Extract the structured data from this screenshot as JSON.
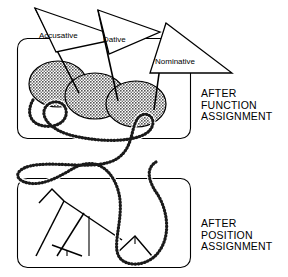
{
  "figure": {
    "background_color": "#ffffff",
    "ink_color": "#000000",
    "ellipse_fill_color": "#9a9a9a"
  },
  "panels": [
    {
      "id": "function-assignment",
      "caption_lines": [
        "AFTER",
        "FUNCTION",
        "ASSIGNMENT"
      ],
      "caption_text": "AFTER\nFUNCTION\nASSIGNMENT",
      "box": {
        "x": 17,
        "y": 38,
        "width": 174,
        "height": 101,
        "radius": 10
      },
      "flags": [
        {
          "label": "Accusative",
          "pole_x": 79,
          "pole_top": 18,
          "pole_bottom": 93
        },
        {
          "label": "Dative",
          "pole_x": 118,
          "pole_top": 10,
          "pole_bottom": 101
        },
        {
          "label": "Nominative",
          "pole_x": 154,
          "pole_top": 23,
          "pole_bottom": 110
        }
      ],
      "blobs": [
        {
          "cx": 58,
          "cy": 84,
          "rx": 29,
          "ry": 23
        },
        {
          "cx": 95,
          "cy": 96,
          "rx": 30,
          "ry": 23
        },
        {
          "cx": 136,
          "cy": 104,
          "rx": 30,
          "ry": 23
        }
      ]
    },
    {
      "id": "position-assignment",
      "caption_lines": [
        "AFTER",
        "POSITION",
        "ASSIGNMENT"
      ],
      "caption_text": "AFTER\nPOSITION\nASSIGNMENT",
      "box": {
        "x": 17,
        "y": 178,
        "width": 174,
        "height": 90,
        "radius": 10
      },
      "tree_description": "syntactic tree with slanted branches and terminal legs"
    }
  ],
  "chain": {
    "style": "beaded-dotted-curve",
    "description": "dotted snake-like chain threading from the upper box down through the lower box"
  }
}
